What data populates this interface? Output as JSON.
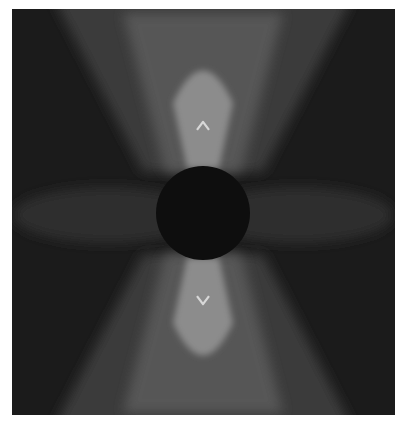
{
  "figure": {
    "type": "vector-field",
    "colors": {
      "background": "#1b1b1b",
      "outer_glow": "#3a3a3a",
      "mid_glow": "#575757",
      "inner_glow": "#8c8c8c",
      "side_lobe": "#2e2e2e",
      "inclusion": "#0e0e0e",
      "arrow": "#d8d8d8",
      "marker": "#9a9a9a"
    },
    "grid": {
      "columns": 15,
      "rows": 15
    },
    "inclusion": {
      "shape": "circle",
      "label": ""
    },
    "arrows": [
      {
        "name": "up-arrow",
        "direction": "up",
        "magnitude": 1.0
      },
      {
        "name": "down-arrow",
        "direction": "down",
        "magnitude": 1.0
      }
    ]
  }
}
